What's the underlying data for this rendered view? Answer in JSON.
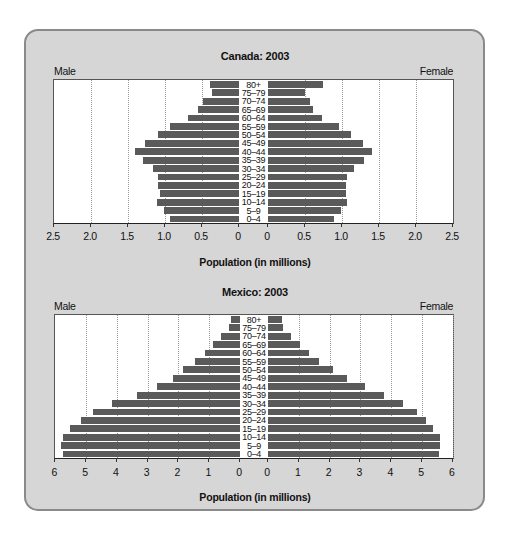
{
  "chart_data": [
    {
      "type": "bar",
      "orientation": "horizontal",
      "subtype": "population-pyramid",
      "title": "Canada: 2003",
      "xlabel": "Population (in millions)",
      "ylabel": "",
      "left_label": "Male",
      "right_label": "Female",
      "xlim": [
        0,
        2.5
      ],
      "ticks": [
        "2.5",
        "2.0",
        "1.5",
        "1.0",
        "0.5",
        "0"
      ],
      "grid": true,
      "categories": [
        "80+",
        "75–79",
        "70–74",
        "65–69",
        "60–64",
        "55–59",
        "50–54",
        "45–49",
        "40–44",
        "35–39",
        "30–34",
        "25–29",
        "20–24",
        "15–19",
        "10–14",
        "5–9",
        "0–4"
      ],
      "series": [
        {
          "name": "Male",
          "values": [
            0.39,
            0.36,
            0.49,
            0.55,
            0.69,
            0.93,
            1.09,
            1.27,
            1.4,
            1.3,
            1.16,
            1.09,
            1.09,
            1.07,
            1.11,
            1.02,
            0.93
          ]
        },
        {
          "name": "Female",
          "values": [
            0.74,
            0.5,
            0.57,
            0.61,
            0.73,
            0.96,
            1.12,
            1.28,
            1.4,
            1.3,
            1.16,
            1.07,
            1.06,
            1.05,
            1.07,
            0.98,
            0.89
          ]
        }
      ]
    },
    {
      "type": "bar",
      "orientation": "horizontal",
      "subtype": "population-pyramid",
      "title": "Mexico: 2003",
      "xlabel": "Population (in millions)",
      "ylabel": "",
      "left_label": "Male",
      "right_label": "Female",
      "xlim": [
        0,
        6
      ],
      "ticks": [
        "6",
        "5",
        "4",
        "3",
        "2",
        "1",
        "0"
      ],
      "grid": true,
      "categories": [
        "80+",
        "75–79",
        "70–74",
        "65–69",
        "60–64",
        "55–59",
        "50–54",
        "45–49",
        "40–44",
        "35–39",
        "30–34",
        "25–29",
        "20–24",
        "15–19",
        "10–14",
        "5–9",
        "0–4"
      ],
      "series": [
        {
          "name": "Male",
          "values": [
            0.3,
            0.36,
            0.62,
            0.89,
            1.15,
            1.46,
            1.85,
            2.18,
            2.71,
            3.34,
            4.16,
            4.77,
            5.16,
            5.52,
            5.75,
            5.8,
            5.75
          ]
        },
        {
          "name": "Female",
          "values": [
            0.45,
            0.5,
            0.76,
            1.05,
            1.33,
            1.67,
            2.11,
            2.56,
            3.14,
            3.76,
            4.38,
            4.83,
            5.12,
            5.37,
            5.57,
            5.6,
            5.54
          ]
        }
      ]
    }
  ],
  "colors": {
    "bar": "#5a5a5a",
    "card_bg": "#d6d6d6",
    "card_border": "#8a8a8a",
    "plot_bg": "#ffffff"
  }
}
